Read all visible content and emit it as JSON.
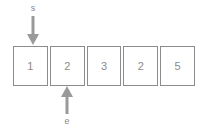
{
  "diagram": {
    "type": "array-with-pointers",
    "array": {
      "name": "array-track",
      "cells": [
        {
          "index": 0,
          "value": "1"
        },
        {
          "index": 1,
          "value": "2"
        },
        {
          "index": 2,
          "value": "3"
        },
        {
          "index": 3,
          "value": "2"
        },
        {
          "index": 4,
          "value": "5"
        }
      ]
    },
    "pointers": [
      {
        "id": "start",
        "label": "s",
        "direction": "down",
        "position": "above",
        "target_index": 0,
        "icon": "arrow-down-icon"
      },
      {
        "id": "end",
        "label": "e",
        "direction": "up",
        "position": "below",
        "target_index": 1,
        "icon": "arrow-up-icon"
      }
    ],
    "colors": {
      "background": "#ffffff",
      "cell_border": "#8c8c8c",
      "cell_fill": "#ffffff",
      "text": "#8a8a8a",
      "arrow": "#9a9a9a"
    }
  }
}
